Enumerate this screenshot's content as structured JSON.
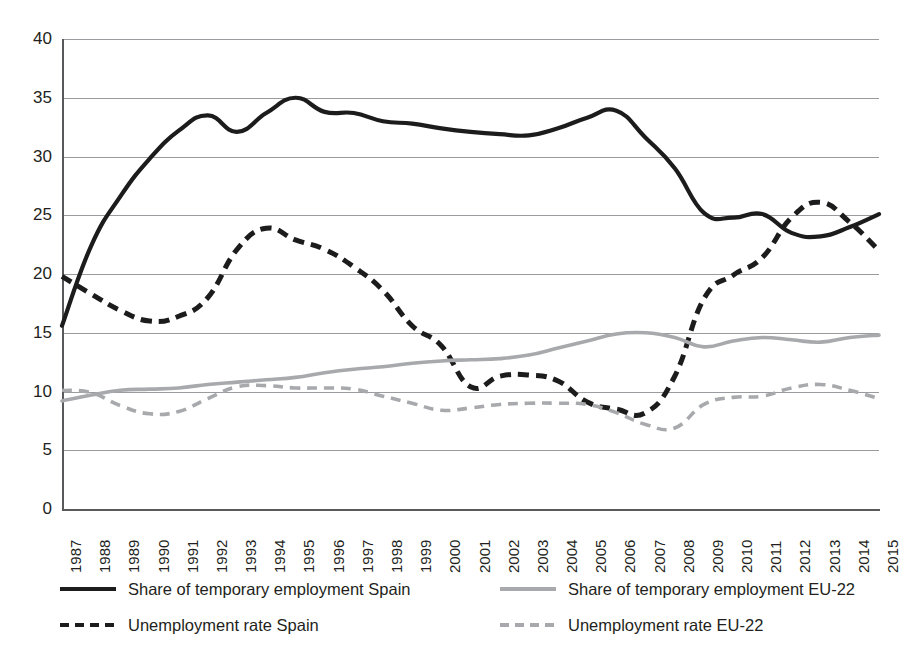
{
  "chart_data": {
    "type": "line",
    "title": "",
    "xlabel": "",
    "ylabel": "",
    "ylim": [
      0,
      40
    ],
    "ytick_values": [
      0,
      5,
      10,
      15,
      20,
      25,
      30,
      35,
      40
    ],
    "grid": "horizontal",
    "legend_position": "bottom",
    "x": [
      1987,
      1988,
      1989,
      1990,
      1991,
      1992,
      1993,
      1994,
      1995,
      1996,
      1997,
      1998,
      1999,
      2000,
      2001,
      2002,
      2003,
      2004,
      2005,
      2006,
      2007,
      2008,
      2009,
      2010,
      2011,
      2012,
      2013,
      2014,
      2015
    ],
    "series": [
      {
        "name": "Share of temporary employment Spain",
        "style": "solid",
        "color": "#1c1c1c",
        "values": [
          15.6,
          22.4,
          26.6,
          29.8,
          32.2,
          33.5,
          32.1,
          33.7,
          35.0,
          33.8,
          33.7,
          33.0,
          32.8,
          32.4,
          32.1,
          31.9,
          31.8,
          32.4,
          33.3,
          33.9,
          31.6,
          29.0,
          25.2,
          24.8,
          25.1,
          23.5,
          23.2,
          24.0,
          25.1
        ]
      },
      {
        "name": "Unemployment rate Spain",
        "style": "dashed",
        "color": "#1c1c1c",
        "values": [
          19.8,
          18.3,
          16.9,
          16.0,
          16.4,
          18.0,
          22.1,
          23.9,
          22.9,
          22.1,
          20.6,
          18.6,
          15.6,
          13.9,
          10.4,
          11.3,
          11.4,
          10.9,
          9.1,
          8.5,
          8.2,
          11.3,
          17.9,
          19.9,
          21.4,
          24.8,
          26.1,
          24.4,
          22.0
        ]
      },
      {
        "name": "Share of temporary employment EU-22",
        "style": "solid",
        "color": "#a7a9ac",
        "values": [
          9.2,
          9.7,
          10.1,
          10.2,
          10.3,
          10.6,
          10.8,
          11.0,
          11.2,
          11.6,
          11.9,
          12.1,
          12.4,
          12.6,
          12.7,
          12.8,
          13.1,
          13.7,
          14.3,
          14.9,
          15.0,
          14.6,
          13.8,
          14.3,
          14.6,
          14.4,
          14.2,
          14.6,
          14.8
        ]
      },
      {
        "name": "Unemployment rate EU-22",
        "style": "dashed",
        "color": "#a7a9ac",
        "values": [
          10.1,
          9.9,
          8.8,
          8.1,
          8.3,
          9.4,
          10.4,
          10.5,
          10.3,
          10.3,
          10.2,
          9.6,
          9.0,
          8.4,
          8.6,
          8.9,
          9.0,
          9.0,
          8.9,
          8.2,
          7.2,
          6.9,
          8.9,
          9.5,
          9.6,
          10.3,
          10.6,
          10.1,
          9.4
        ]
      }
    ]
  },
  "legend": {
    "items": [
      {
        "label": "Share of temporary employment Spain",
        "swatch": "solid-dark"
      },
      {
        "label": "Share of temporary employment EU-22",
        "swatch": "solid-gray"
      },
      {
        "label": "Unemployment rate Spain",
        "swatch": "dash-dark"
      },
      {
        "label": "Unemployment rate EU-22",
        "swatch": "dash-gray"
      }
    ]
  }
}
